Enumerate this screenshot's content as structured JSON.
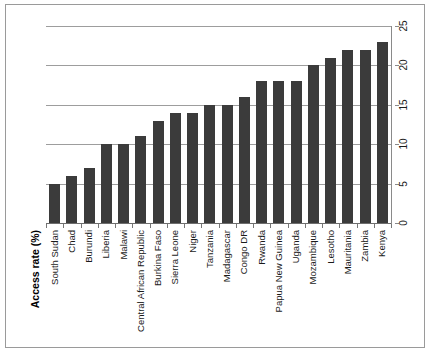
{
  "chart_data": {
    "type": "bar",
    "title": "",
    "subtitle": "",
    "xlabel": "",
    "ylabel": "Access rate (%)",
    "ylim": [
      0,
      25
    ],
    "ytick_labels": [
      "0",
      "5",
      "10",
      "15",
      "20",
      "25"
    ],
    "ytick_values": [
      0,
      5,
      10,
      15,
      20,
      25
    ],
    "grid": true,
    "legend": false,
    "legend_position": "none",
    "value_axis_side": "right",
    "category_label_rotation": -90,
    "bar_color": "#3b3b3b",
    "gridline_color": "#9d9d9d",
    "categories": [
      "South Sudan",
      "Chad",
      "Burundi",
      "Liberia",
      "Malawi",
      "Central African Republic",
      "Burkina Faso",
      "Sierra Leone",
      "Niger",
      "Tanzania",
      "Madagascar",
      "Congo DR",
      "Rwanda",
      "Papua New Guinea",
      "Uganda",
      "Mozambique",
      "Lesotho",
      "Mauritania",
      "Zambia",
      "Kenya"
    ],
    "values": [
      5,
      6,
      7,
      10,
      10,
      11,
      13,
      14,
      14,
      15,
      15,
      16,
      18,
      18,
      18,
      20,
      21,
      22,
      22,
      23
    ]
  }
}
